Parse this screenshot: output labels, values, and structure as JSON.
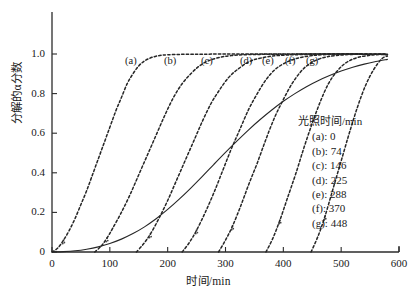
{
  "figure": {
    "background": "#ffffff",
    "axis_color": "#2b2b2b",
    "curve_color": "#262626"
  },
  "axes": {
    "x": {
      "title": "时间/min",
      "ticks": [
        0,
        100,
        200,
        300,
        400,
        500,
        600
      ],
      "tick_labels": [
        "0",
        "100",
        "200",
        "300",
        "400",
        "500",
        "600"
      ],
      "min": 0,
      "max": 600
    },
    "y": {
      "title": "分解的α分数",
      "ticks": [
        0,
        0.2,
        0.4,
        0.6,
        0.8,
        1.0
      ],
      "tick_labels": [
        "0",
        "0.2",
        "0.4",
        "0.6",
        "0.8",
        "1.0"
      ],
      "min": 0,
      "max": 1.1
    }
  },
  "legend": {
    "title": "光照时间/min",
    "entries": [
      {
        "key": "(a)",
        "label": "(a): 0",
        "value": 0
      },
      {
        "key": "(b)",
        "label": "(b): 74",
        "value": 74
      },
      {
        "key": "(c)",
        "label": "(c): 146",
        "value": 146
      },
      {
        "key": "(d)",
        "label": "(d): 225",
        "value": 225
      },
      {
        "key": "(e)",
        "label": "(e): 288",
        "value": 288
      },
      {
        "key": "(f)",
        "label": "(f): 370",
        "value": 370
      },
      {
        "key": "(g)",
        "label": "(g): 448",
        "value": 448
      }
    ]
  },
  "curve_labels": [
    {
      "text": "(a)",
      "x": 125,
      "y": 55
    },
    {
      "text": "(b)",
      "x": 164,
      "y": 55
    },
    {
      "text": "(c)",
      "x": 201,
      "y": 55
    },
    {
      "text": "(d)",
      "x": 240,
      "y": 55
    },
    {
      "text": "(e)",
      "x": 262,
      "y": 55
    },
    {
      "text": "(f)",
      "x": 285,
      "y": 55
    },
    {
      "text": "(g)",
      "x": 306,
      "y": 55
    }
  ],
  "chart_data": {
    "type": "line",
    "title": "",
    "xlabel": "时间/min",
    "ylabel": "分解的α分数",
    "xlim": [
      0,
      600
    ],
    "ylim": [
      0,
      1.1
    ],
    "grid": false,
    "legend_position": "right-inside",
    "legend_title": "光照时间/min",
    "series": [
      {
        "name": "(a): 0",
        "style": "dashed",
        "induction_time": 0,
        "x": [
          0,
          10,
          20,
          30,
          40,
          50,
          60,
          70,
          80,
          90,
          100,
          110,
          120,
          130,
          140,
          150,
          160,
          170,
          180,
          190,
          200,
          220,
          240,
          260,
          300,
          400,
          500,
          580
        ],
        "y": [
          0.0,
          0.02,
          0.06,
          0.11,
          0.17,
          0.24,
          0.31,
          0.39,
          0.47,
          0.55,
          0.63,
          0.71,
          0.78,
          0.85,
          0.9,
          0.94,
          0.965,
          0.98,
          0.989,
          0.994,
          0.996,
          0.998,
          0.999,
          0.999,
          1.0,
          1.0,
          1.0,
          0.998
        ]
      },
      {
        "name": "(b): 74",
        "style": "dashed",
        "induction_time": 74,
        "x": [
          74,
          85,
          95,
          105,
          120,
          135,
          150,
          165,
          180,
          195,
          210,
          225,
          240,
          255,
          270,
          290,
          310,
          340,
          400,
          500,
          580
        ],
        "y": [
          0.0,
          0.03,
          0.07,
          0.12,
          0.2,
          0.29,
          0.39,
          0.49,
          0.59,
          0.69,
          0.78,
          0.85,
          0.9,
          0.94,
          0.965,
          0.983,
          0.992,
          0.997,
          0.999,
          1.0,
          0.998
        ]
      },
      {
        "name": "(c): 146",
        "style": "dashed",
        "induction_time": 146,
        "x": [
          146,
          158,
          170,
          185,
          200,
          215,
          230,
          245,
          260,
          275,
          290,
          305,
          320,
          340,
          360,
          390,
          440,
          500,
          580
        ],
        "y": [
          0.0,
          0.04,
          0.09,
          0.17,
          0.26,
          0.36,
          0.46,
          0.56,
          0.66,
          0.75,
          0.82,
          0.88,
          0.92,
          0.96,
          0.979,
          0.992,
          0.998,
          1.0,
          0.998
        ]
      },
      {
        "name": "(d): 225",
        "style": "dashed",
        "induction_time": 225,
        "x": [
          225,
          238,
          250,
          265,
          280,
          295,
          310,
          325,
          340,
          355,
          370,
          385,
          400,
          420,
          450,
          500,
          580
        ],
        "y": [
          0.0,
          0.05,
          0.11,
          0.2,
          0.3,
          0.41,
          0.52,
          0.62,
          0.72,
          0.8,
          0.87,
          0.92,
          0.95,
          0.975,
          0.992,
          1.0,
          0.998
        ]
      },
      {
        "name": "(e): 288",
        "style": "dashed",
        "induction_time": 288,
        "x": [
          288,
          300,
          312,
          326,
          340,
          355,
          370,
          385,
          400,
          415,
          430,
          445,
          465,
          490,
          530,
          580
        ],
        "y": [
          0.0,
          0.06,
          0.13,
          0.23,
          0.34,
          0.45,
          0.57,
          0.68,
          0.77,
          0.85,
          0.91,
          0.95,
          0.978,
          0.992,
          0.999,
          0.998
        ]
      },
      {
        "name": "(f): 370",
        "style": "dashed",
        "induction_time": 370,
        "x": [
          370,
          382,
          394,
          408,
          422,
          436,
          450,
          464,
          478,
          492,
          508,
          528,
          555,
          580
        ],
        "y": [
          0.0,
          0.07,
          0.16,
          0.28,
          0.4,
          0.53,
          0.65,
          0.76,
          0.85,
          0.91,
          0.955,
          0.982,
          0.995,
          0.998
        ]
      },
      {
        "name": "(g): 448",
        "style": "dashed",
        "induction_time": 448,
        "x": [
          448,
          460,
          472,
          486,
          500,
          514,
          528,
          542,
          556,
          570,
          580
        ],
        "y": [
          0.0,
          0.08,
          0.18,
          0.32,
          0.46,
          0.6,
          0.73,
          0.84,
          0.92,
          0.975,
          0.99
        ]
      },
      {
        "name": "envelope",
        "style": "solid",
        "x": [
          0,
          20,
          40,
          60,
          80,
          100,
          120,
          140,
          160,
          180,
          200,
          220,
          240,
          260,
          280,
          300,
          320,
          340,
          360,
          380,
          400,
          420,
          440,
          460,
          480,
          500,
          520,
          540,
          560,
          580
        ],
        "y": [
          0.0,
          0.002,
          0.006,
          0.014,
          0.026,
          0.043,
          0.065,
          0.093,
          0.127,
          0.168,
          0.215,
          0.267,
          0.323,
          0.382,
          0.443,
          0.503,
          0.561,
          0.617,
          0.669,
          0.717,
          0.761,
          0.8,
          0.835,
          0.865,
          0.891,
          0.914,
          0.933,
          0.949,
          0.962,
          0.973
        ]
      }
    ]
  }
}
